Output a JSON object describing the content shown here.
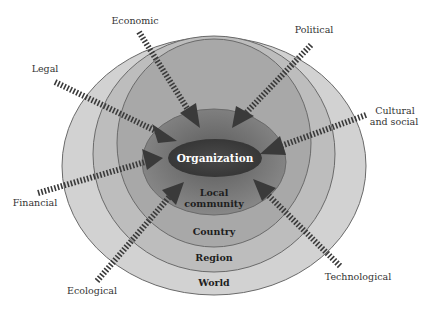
{
  "diagram": {
    "center": "Organization",
    "rings": [
      {
        "id": "local",
        "label_lines": [
          "Local",
          "community"
        ],
        "fill": "#7e7e7e"
      },
      {
        "id": "country",
        "label_lines": [
          "Country"
        ],
        "fill": "#a2a2a2"
      },
      {
        "id": "region",
        "label_lines": [
          "Region"
        ],
        "fill": "#b8b8b8"
      },
      {
        "id": "world",
        "label_lines": [
          "World"
        ],
        "fill": "#cecece"
      }
    ],
    "forces": [
      {
        "id": "legal",
        "label": "Legal"
      },
      {
        "id": "economic",
        "label": "Economic"
      },
      {
        "id": "political",
        "label": "Political"
      },
      {
        "id": "cultural",
        "label_lines": [
          "Cultural",
          "and social"
        ]
      },
      {
        "id": "financial",
        "label": "Financial"
      },
      {
        "id": "ecological",
        "label": "Ecological"
      },
      {
        "id": "technological",
        "label": "Technological"
      }
    ],
    "colors": {
      "center": "#3a3a3a",
      "arrow": "#3a3a3a",
      "stroke": "#6a6a6a"
    }
  }
}
